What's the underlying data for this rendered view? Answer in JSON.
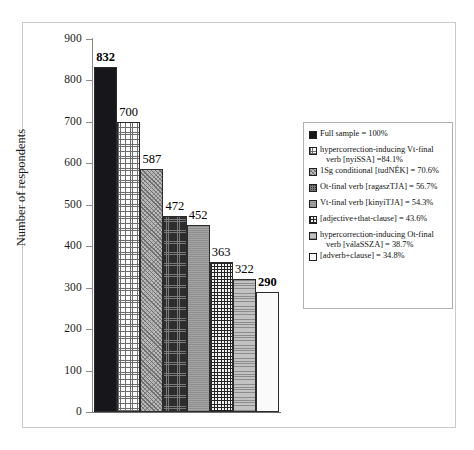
{
  "chart_data": {
    "type": "bar",
    "title": "",
    "xlabel": "",
    "ylabel": "Number of respondents",
    "ylim": [
      0,
      900
    ],
    "ytick_interval": 100,
    "yticks": [
      "900",
      "800",
      "700",
      "600",
      "500",
      "400",
      "300",
      "200",
      "100",
      "0"
    ],
    "grid": false,
    "legend_position": "right",
    "categories": [
      "Full sample = 100%",
      "hypercorrection-inducing Vt-final verb [nyiSSA] =84.1%",
      "1Sg conditional [tudNÉK] = 70.6%",
      "Ot-final verb [ragaszTJA] = 56.7%",
      "Vt-final verb [kinyiTJA] = 54.3%",
      "[adjective+that-clause] = 43.6%",
      "hypercorrection-inducing Ot-final verb [válaSSZA] = 38.7%",
      "[adverb+clause] = 34.8%"
    ],
    "values": [
      832,
      700,
      587,
      472,
      452,
      363,
      322,
      290
    ],
    "value_labels": [
      "832",
      "700",
      "587",
      "472",
      "452",
      "363",
      "322",
      "290"
    ],
    "bold_value_labels": [
      "832",
      "290"
    ],
    "percentages": [
      "100%",
      "84.1%",
      "70.6%",
      "56.7%",
      "54.3%",
      "43.6%",
      "38.7%",
      "34.8%"
    ]
  },
  "axis": {
    "y_title": "Number of respondents",
    "ticks": [
      {
        "label": "900",
        "value": 900
      },
      {
        "label": "800",
        "value": 800
      },
      {
        "label": "700",
        "value": 700
      },
      {
        "label": "600",
        "value": 600
      },
      {
        "label": "500",
        "value": 500
      },
      {
        "label": "400",
        "value": 400
      },
      {
        "label": "300",
        "value": 300
      },
      {
        "label": "200",
        "value": 200
      },
      {
        "label": "100",
        "value": 100
      },
      {
        "label": "0",
        "value": 0
      }
    ]
  },
  "bars": [
    {
      "label": "832",
      "value": 832,
      "bold": true,
      "pattern": "solid-black"
    },
    {
      "label": "700",
      "value": 700,
      "bold": false,
      "pattern": "fine-grid-white"
    },
    {
      "label": "587",
      "value": 587,
      "bold": false,
      "pattern": "diagonal-gray"
    },
    {
      "label": "472",
      "value": 472,
      "bold": false,
      "pattern": "dark-crosshatch"
    },
    {
      "label": "452",
      "value": 452,
      "bold": false,
      "pattern": "mid-gray"
    },
    {
      "label": "363",
      "value": 363,
      "bold": false,
      "pattern": "bold-grid"
    },
    {
      "label": "322",
      "value": 322,
      "bold": false,
      "pattern": "horizontal-gray"
    },
    {
      "label": "290",
      "value": 290,
      "bold": true,
      "pattern": "white"
    }
  ],
  "legend": {
    "items": [
      {
        "line1": "Full sample = 100%",
        "line2": "",
        "pattern": "solid-black"
      },
      {
        "line1": "hypercorrection-inducing Vt-final",
        "line2": "verb [nyiSSA] =84.1%",
        "pattern": "fine-grid-white"
      },
      {
        "line1": "1Sg conditional [tudNÉK] = 70.6%",
        "line2": "",
        "pattern": "diagonal-gray"
      },
      {
        "line1": "Ot-final verb [ragaszTJA] = 56.7%",
        "line2": "",
        "pattern": "dark-crosshatch"
      },
      {
        "line1": "Vt-final verb [kinyiTJA] = 54.3%",
        "line2": "",
        "pattern": "mid-gray"
      },
      {
        "line1": "[adjective+that-clause] = 43.6%",
        "line2": "",
        "pattern": "bold-grid"
      },
      {
        "line1": "hypercorrection-inducing Ot-final",
        "line2": "verb [válaSSZA] = 38.7%",
        "pattern": "horizontal-gray"
      },
      {
        "line1": "[adverb+clause] = 34.8%",
        "line2": "",
        "pattern": "white"
      }
    ]
  },
  "colors": {
    "frame": "#c9c9c9",
    "axis": "#8a8a8a",
    "bar_outline": "#2b2b2b",
    "text": "#111111"
  }
}
